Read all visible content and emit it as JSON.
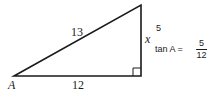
{
  "diagram": {
    "type": "right-triangle",
    "vertices": {
      "A": {
        "label": "A",
        "x": 14,
        "y": 76
      },
      "right_angle": {
        "x": 141,
        "y": 76
      },
      "top": {
        "x": 141,
        "y": 5
      }
    },
    "sides": {
      "hypotenuse": {
        "label": "13"
      },
      "adjacent": {
        "label": "12"
      },
      "opposite": {
        "label": "x",
        "value_label": "5"
      }
    },
    "equation": {
      "lhs": "tan A =",
      "numerator": "5",
      "denominator": "12"
    },
    "stroke_color": "#1a1a1a"
  }
}
